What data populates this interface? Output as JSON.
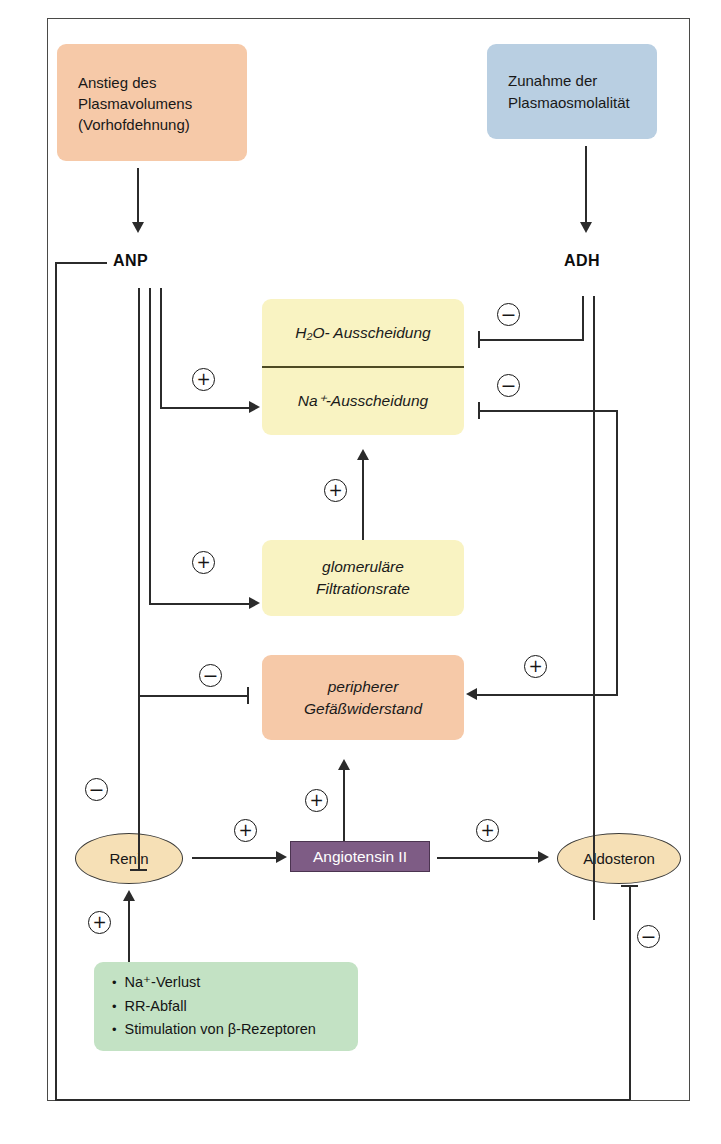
{
  "diagram": {
    "colors": {
      "salmon": "#f6c9a8",
      "blue": "#b9cfe2",
      "yellow": "#f9f3c2",
      "green": "#c3e2c4",
      "purple": "#7e5c85",
      "ellipse": "#f6e0b6",
      "line": "#2b2b2b",
      "frame": "#4a4a48"
    }
  },
  "nodes": {
    "plasmavolumen": {
      "line1": "Anstieg des",
      "line2": "Plasmavolumens",
      "line3": "(Vorhofdehnung)"
    },
    "plasmaosmolalitaet": {
      "line1": "Zunahme der",
      "line2": "Plasmaosmolalität"
    },
    "anp": "ANP",
    "adh": "ADH",
    "ausscheidung": {
      "h2o": "H₂O- Ausscheidung",
      "na": "Na⁺-Ausscheidung"
    },
    "gfr": {
      "line1": "glomeruläre",
      "line2": "Filtrationsrate"
    },
    "widerstand": {
      "line1": "peripherer",
      "line2": "Gefäßwiderstand"
    },
    "renin": "Renin",
    "angiotensin": "Angiotensin II",
    "aldosteron": "Aldosteron",
    "ausloeser": {
      "bullet": "•",
      "item1": "Na⁺-Verlust",
      "item2": "RR-Abfall",
      "item3": "Stimulation von β-Rezeptoren"
    }
  },
  "signs": {
    "plus": "+",
    "minus": "−",
    "anp_to_ausscheidung": "+",
    "anp_to_gfr": "+",
    "anp_to_widerstand": "−",
    "anp_to_renin": "−",
    "adh_to_h2o": "−",
    "adh_to_na": "−",
    "adh_to_widerstand": "+",
    "gfr_to_ausscheidung": "+",
    "ausloeser_to_renin": "+",
    "renin_to_angiotensin": "+",
    "angiotensin_to_widerstand": "+",
    "angiotensin_to_aldosteron": "+",
    "aldosteron_feedback": "−"
  }
}
